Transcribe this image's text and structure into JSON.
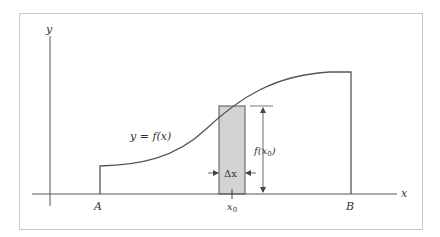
{
  "diagram": {
    "axes": {
      "x_label": "x",
      "y_label": "y"
    },
    "curve_label": "y = f(x)",
    "points": {
      "A": "A",
      "B": "B",
      "x0": "x",
      "x0_sub": "0"
    },
    "rectangle": {
      "width_label": "Δx",
      "height_label_fn": "f(x",
      "height_label_sub": "0",
      "height_label_close": ")"
    },
    "colors": {
      "line": "#555555",
      "frame": "#c8c8c8",
      "rect_fill": "#d3d3d3",
      "text": "#333333"
    }
  }
}
